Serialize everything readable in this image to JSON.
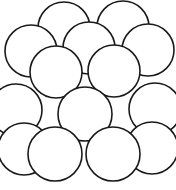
{
  "figure": {
    "width": 176,
    "height": 190,
    "background_color": "#ffffff",
    "stroke_color": "#1a1a1a",
    "fill_color": "#ffffff",
    "stroke_width": 1.6,
    "sphere_radius": 26,
    "layer_count": 3,
    "sphere_count": 14
  },
  "layers": [
    {
      "name": "back-layer",
      "label": "Back layer",
      "spheres": [
        {
          "name": "sphere-back-1",
          "cx": 64,
          "cy": 28,
          "r": 26
        },
        {
          "name": "sphere-back-2",
          "cx": 123,
          "cy": 27,
          "r": 26
        },
        {
          "name": "sphere-back-3",
          "cx": 31,
          "cy": 51,
          "r": 26
        },
        {
          "name": "sphere-back-4",
          "cx": 89,
          "cy": 48,
          "r": 26
        },
        {
          "name": "sphere-back-5",
          "cx": 148,
          "cy": 50,
          "r": 26
        }
      ]
    },
    {
      "name": "middle-layer",
      "label": "Middle layer",
      "spheres": [
        {
          "name": "sphere-middle-1",
          "cx": 56,
          "cy": 72,
          "r": 26
        },
        {
          "name": "sphere-middle-2",
          "cx": 114,
          "cy": 71,
          "r": 26
        },
        {
          "name": "sphere-middle-3",
          "cx": 16,
          "cy": 110,
          "r": 26
        },
        {
          "name": "sphere-middle-4",
          "cx": 155,
          "cy": 109,
          "r": 26
        },
        {
          "name": "sphere-middle-5",
          "cx": 85,
          "cy": 114,
          "r": 27
        }
      ]
    },
    {
      "name": "front-layer",
      "label": "Front layer",
      "spheres": [
        {
          "name": "sphere-front-1",
          "cx": 24,
          "cy": 149,
          "r": 26
        },
        {
          "name": "sphere-front-2",
          "cx": 152,
          "cy": 148,
          "r": 26
        },
        {
          "name": "sphere-front-3",
          "cx": 55,
          "cy": 154,
          "r": 27
        },
        {
          "name": "sphere-front-4",
          "cx": 113,
          "cy": 154,
          "r": 27
        }
      ]
    }
  ]
}
